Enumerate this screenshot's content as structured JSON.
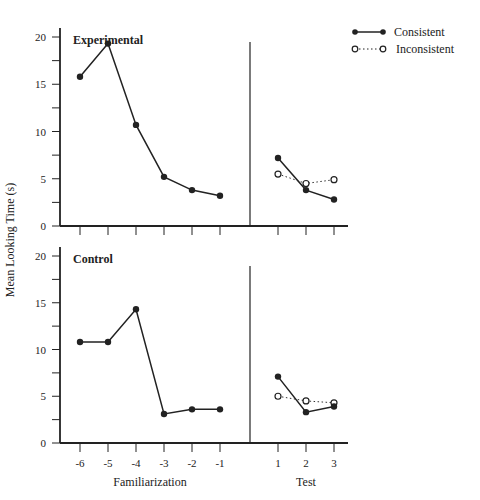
{
  "chart_data": [
    {
      "type": "line",
      "panel": "Experimental",
      "title": "Experimental",
      "ylabel": "Mean Looking Time (s)",
      "ylim": [
        0,
        20
      ],
      "yticks": [
        0,
        5,
        10,
        15,
        20
      ],
      "familiarization": {
        "x": [
          -6,
          -5,
          -4,
          -3,
          -2,
          -1
        ],
        "values": [
          15.8,
          19.3,
          10.7,
          5.2,
          3.8,
          3.2
        ]
      },
      "test": {
        "x": [
          1,
          2,
          3
        ],
        "series": [
          {
            "name": "Consistent",
            "values": [
              7.2,
              3.8,
              2.8
            ]
          },
          {
            "name": "Inconsistent",
            "values": [
              5.5,
              4.5,
              4.9
            ]
          }
        ]
      }
    },
    {
      "type": "line",
      "panel": "Control",
      "title": "Control",
      "ylabel": "Mean Looking Time (s)",
      "ylim": [
        0,
        20
      ],
      "yticks": [
        0,
        5,
        10,
        15,
        20
      ],
      "familiarization": {
        "x": [
          -6,
          -5,
          -4,
          -3,
          -2,
          -1
        ],
        "values": [
          10.8,
          10.8,
          14.3,
          3.1,
          3.6,
          3.6
        ]
      },
      "test": {
        "x": [
          1,
          2,
          3
        ],
        "series": [
          {
            "name": "Consistent",
            "values": [
              7.1,
              3.3,
              3.9
            ]
          },
          {
            "name": "Inconsistent",
            "values": [
              5.0,
              4.5,
              4.3
            ]
          }
        ]
      }
    }
  ],
  "labels": {
    "ylabel": "Mean Looking Time (s)",
    "xlabel_familiarization": "Familiarization",
    "xlabel_test": "Test",
    "panel_top": "Experimental",
    "panel_bottom": "Control",
    "xticks_fam": [
      "-6",
      "-5",
      "-4",
      "-3",
      "-2",
      "-1"
    ],
    "xticks_test": [
      "1",
      "2",
      "3"
    ],
    "yticks": [
      "0",
      "5",
      "10",
      "15",
      "20"
    ]
  },
  "legend": {
    "items": [
      {
        "name": "Consistent",
        "marker": "filled-circle",
        "line": "solid"
      },
      {
        "name": "Inconsistent",
        "marker": "open-circle",
        "line": "dotted"
      }
    ]
  }
}
